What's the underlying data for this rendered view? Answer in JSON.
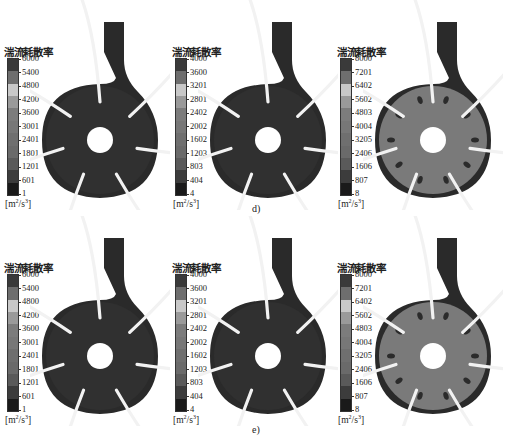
{
  "figure": {
    "rows": [
      {
        "caption": "d)",
        "panels": [
          {
            "legend_title": "湍流耗散率",
            "ticks": [
              "6000",
              "5400",
              "4800",
              "4200",
              "3600",
              "3001",
              "2401",
              "1801",
              "1201",
              "601",
              "1"
            ],
            "unit_base": "[m",
            "unit_exp1": "2",
            "unit_mid": "/s",
            "unit_exp2": "3",
            "unit_end": "]"
          },
          {
            "legend_title": "湍流耗散率",
            "ticks": [
              "4000",
              "3600",
              "3201",
              "2801",
              "2402",
              "2002",
              "1602",
              "1203",
              "803",
              "404",
              "4"
            ],
            "unit_base": "[m",
            "unit_exp1": "2",
            "unit_mid": "/s",
            "unit_exp2": "3",
            "unit_end": "]"
          },
          {
            "legend_title": "湍流耗散率",
            "ticks": [
              "8000",
              "7201",
              "6402",
              "5602",
              "4803",
              "4004",
              "3205",
              "2406",
              "1606",
              "807",
              "8"
            ],
            "unit_base": "[m",
            "unit_exp1": "2",
            "unit_mid": "/s",
            "unit_exp2": "3",
            "unit_end": "]"
          }
        ]
      },
      {
        "caption": "e)",
        "panels": [
          {
            "legend_title": "湍流耗散率",
            "ticks": [
              "6000",
              "5400",
              "4800",
              "4200",
              "3600",
              "3001",
              "2401",
              "1801",
              "1201",
              "601",
              "1"
            ],
            "unit_base": "[m",
            "unit_exp1": "2",
            "unit_mid": "/s",
            "unit_exp2": "3",
            "unit_end": "]"
          },
          {
            "legend_title": "湍流耗散率",
            "ticks": [
              "4000",
              "3600",
              "3201",
              "2801",
              "2402",
              "2002",
              "1602",
              "1203",
              "803",
              "404",
              "4"
            ],
            "unit_base": "[m",
            "unit_exp1": "2",
            "unit_mid": "/s",
            "unit_exp2": "3",
            "unit_end": "]"
          },
          {
            "legend_title": "湍流耗散率",
            "ticks": [
              "8000",
              "7201",
              "6402",
              "5602",
              "4803",
              "4004",
              "3205",
              "2406",
              "1606",
              "807",
              "8"
            ],
            "unit_base": "[m",
            "unit_exp1": "2",
            "unit_mid": "/s",
            "unit_exp2": "3",
            "unit_end": "]"
          }
        ]
      }
    ],
    "colorbar_bands": [
      "#3a3a3a",
      "#6e6e6e",
      "#c8c8c8",
      "#9a9a9a",
      "#7c7c7c",
      "#777777",
      "#6f6f6f",
      "#6a6a6a",
      "#5a5a5a",
      "#3c3c3c",
      "#1a1a1a"
    ],
    "pump_colors": {
      "volute_dark": "#2a2a2a",
      "blade": "#f2f2f2",
      "field_low": "#303030",
      "field_high": "#7a7a7a"
    }
  }
}
